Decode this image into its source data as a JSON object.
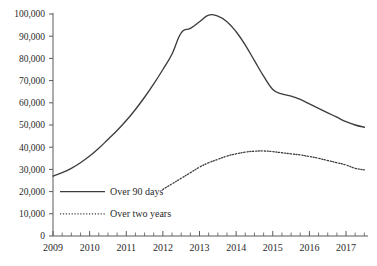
{
  "chart_data": {
    "type": "line",
    "title": "",
    "subtitle": "",
    "xlabel": "",
    "ylabel": "",
    "xlim": [
      2009.0,
      2017.6
    ],
    "ylim": [
      0,
      100000
    ],
    "grid": false,
    "legend_position": "inside-lower-left",
    "y_ticks": [
      0,
      10000,
      20000,
      30000,
      40000,
      50000,
      60000,
      70000,
      80000,
      90000,
      100000
    ],
    "y_tick_labels": [
      "0",
      "10,000",
      "20,000",
      "30,000",
      "40,000",
      "50,000",
      "60,000",
      "70,000",
      "80,000",
      "90,000",
      "100,000"
    ],
    "x_ticks": [
      2009,
      2010,
      2011,
      2012,
      2013,
      2014,
      2015,
      2016,
      2017
    ],
    "x_tick_labels": [
      "2009",
      "2010",
      "2011",
      "2012",
      "2013",
      "2014",
      "2015",
      "2016",
      "2017"
    ],
    "x_minor_tick_interval": 0.25,
    "series": [
      {
        "name": "Over 90 days",
        "style": "solid",
        "color": "#3d3d3d",
        "x": [
          2009.0,
          2009.25,
          2009.5,
          2009.75,
          2010.0,
          2010.25,
          2010.5,
          2010.75,
          2011.0,
          2011.25,
          2011.5,
          2011.75,
          2012.0,
          2012.25,
          2012.5,
          2012.75,
          2013.0,
          2013.25,
          2013.5,
          2013.75,
          2014.0,
          2014.25,
          2014.5,
          2014.75,
          2015.0,
          2015.25,
          2015.5,
          2015.75,
          2016.0,
          2016.25,
          2016.5,
          2016.75,
          2017.0,
          2017.25,
          2017.5
        ],
        "values": [
          27000,
          28500,
          30500,
          33000,
          36000,
          39500,
          43500,
          47500,
          52000,
          57000,
          62500,
          68500,
          75000,
          82000,
          91500,
          93500,
          96500,
          99500,
          99000,
          96500,
          92000,
          86000,
          79000,
          72000,
          66000,
          64000,
          63000,
          61500,
          59500,
          57500,
          55500,
          53500,
          51500,
          50000,
          49000
        ]
      },
      {
        "name": "Over two years",
        "style": "dotted",
        "color": "#3d3d3d",
        "x": [
          2012.0,
          2012.25,
          2012.5,
          2012.75,
          2013.0,
          2013.25,
          2013.5,
          2013.75,
          2014.0,
          2014.25,
          2014.5,
          2014.75,
          2015.0,
          2015.25,
          2015.5,
          2015.75,
          2016.0,
          2016.25,
          2016.5,
          2016.75,
          2017.0,
          2017.25,
          2017.5
        ],
        "values": [
          21000,
          23500,
          26000,
          28500,
          31000,
          33000,
          34500,
          36000,
          37000,
          37800,
          38200,
          38300,
          38000,
          37500,
          37000,
          36500,
          35800,
          35000,
          34000,
          33000,
          32000,
          30500,
          29800
        ]
      }
    ],
    "legend": [
      {
        "label": "Over 90 days",
        "style": "solid"
      },
      {
        "label": "Over two years",
        "style": "dotted"
      }
    ]
  }
}
